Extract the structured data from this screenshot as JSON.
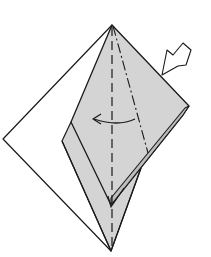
{
  "diagram": {
    "type": "origami-fold-step",
    "colors": {
      "background": "#ffffff",
      "paper_white": "#ffffff",
      "paper_colored": "#d4d4d4",
      "stroke": "#1a1a1a"
    },
    "elements": {
      "white_layer": "back paper layer (white side)",
      "gray_flap": "front folded flap (colored side)",
      "valley_fold_line": "vertical dashed center line",
      "mountain_fold_line": "dash-dot diagonal line",
      "fold_arrow": "curved arrow pointing left",
      "push_arrow": "hollow push/squash arrow at upper right"
    }
  }
}
